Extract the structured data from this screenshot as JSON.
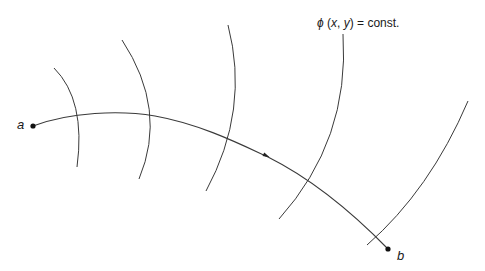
{
  "diagram": {
    "equipotential_label": {
      "phi": "ϕ",
      "args": "(x, y)",
      "rest": " = const."
    },
    "start_point": {
      "label": "a",
      "x": 33,
      "y": 126
    },
    "end_point": {
      "label": "b",
      "x": 388,
      "y": 249
    },
    "path": {
      "d": "M33,126 C70,112 120,110 155,116 C200,124 240,144 268,157 C310,178 350,210 388,249",
      "arrow": {
        "x": 267,
        "y": 156,
        "angle": 26
      }
    },
    "level_curves": [
      {
        "d": "M54,68 Q86,100 77,167"
      },
      {
        "d": "M122,40 Q168,110 139,179"
      },
      {
        "d": "M228,25 Q250,110 206,191"
      },
      {
        "d": "M343,34 Q350,140 279,219"
      },
      {
        "d": "M468,101 Q430,190 367,245"
      }
    ],
    "colors": {
      "stroke": "#3a3a3a",
      "point": "#111111",
      "background": "#ffffff"
    }
  }
}
